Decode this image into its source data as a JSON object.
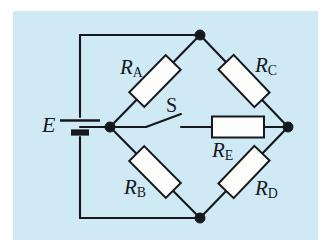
{
  "figure": {
    "kind": "circuit-diagram",
    "panel_color": "#cfe9f5",
    "wire_color": "#15181c",
    "resistor_fill": "#fdfdfb",
    "background_color": "#ffffff"
  },
  "labels": {
    "source": {
      "symbol": "E",
      "component": "battery"
    },
    "switch": {
      "symbol": "S",
      "state": "open"
    },
    "resistors": [
      {
        "symbol": "R",
        "subscript": "A",
        "orientation": "diagonal-up-right",
        "position": "upper-left-branch"
      },
      {
        "symbol": "R",
        "subscript": "C",
        "orientation": "diagonal-down-right",
        "position": "upper-right-branch"
      },
      {
        "symbol": "R",
        "subscript": "B",
        "orientation": "diagonal-down-right",
        "position": "lower-left-branch"
      },
      {
        "symbol": "R",
        "subscript": "D",
        "orientation": "diagonal-up-right",
        "position": "lower-right-branch"
      },
      {
        "symbol": "R",
        "subscript": "E",
        "orientation": "horizontal",
        "position": "bridge-branch"
      }
    ]
  },
  "nodes": [
    {
      "name": "top",
      "x": 200,
      "y": 35
    },
    {
      "name": "left",
      "x": 110,
      "y": 127
    },
    {
      "name": "right",
      "x": 288,
      "y": 127
    },
    {
      "name": "bottom",
      "x": 200,
      "y": 218
    }
  ]
}
